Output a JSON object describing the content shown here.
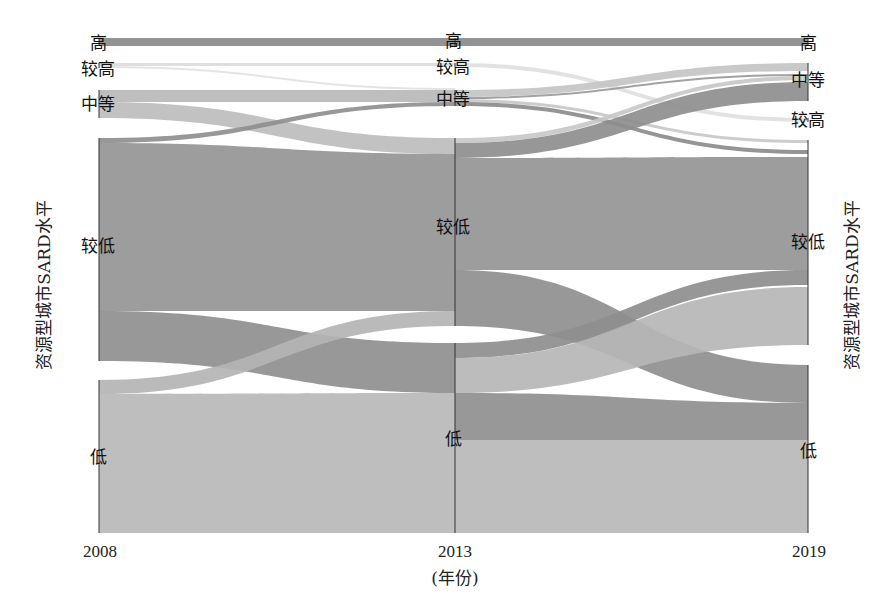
{
  "chart_data": {
    "type": "alluvial",
    "title": "",
    "xlabel": "(年份)",
    "ylabel_left": "资源型城市SARD水平",
    "ylabel_right": "资源型城市SARD水平",
    "columns": [
      "2008",
      "2013",
      "2019"
    ],
    "levels": [
      "高",
      "较高",
      "中等",
      "较低",
      "低"
    ],
    "nodes": {
      "2008": [
        {
          "level": "高",
          "y0": 38,
          "y1": 46
        },
        {
          "level": "较高",
          "y0": 63,
          "y1": 68
        },
        {
          "level": "中等",
          "y0": 90,
          "y1": 118
        },
        {
          "level": "较低",
          "y0": 138,
          "y1": 361
        },
        {
          "level": "低",
          "y0": 380,
          "y1": 533
        }
      ],
      "2013": [
        {
          "level": "高",
          "y0": 38,
          "y1": 46
        },
        {
          "level": "较高",
          "y0": 63,
          "y1": 67
        },
        {
          "level": "中等",
          "y0": 90,
          "y1": 106
        },
        {
          "level": "较低",
          "y0": 138,
          "y1": 326
        },
        {
          "level": "低",
          "y0": 343,
          "y1": 533
        }
      ],
      "2019": [
        {
          "level": "高",
          "y0": 38,
          "y1": 46
        },
        {
          "level": "中等",
          "y0": 63,
          "y1": 101
        },
        {
          "level": "较高",
          "y0": 118,
          "y1": 122
        },
        {
          "level": "较低",
          "y0": 140,
          "y1": 345
        },
        {
          "level": "低",
          "y0": 365,
          "y1": 533
        }
      ]
    },
    "flows": [
      {
        "from": "2008.高",
        "to": "2013.高",
        "sy0": 38,
        "sy1": 46,
        "ty0": 38,
        "ty1": 46,
        "color": "#8a8a8a"
      },
      {
        "from": "2008.较高",
        "to": "2013.较高",
        "sy0": 63,
        "sy1": 66,
        "ty0": 63,
        "ty1": 66,
        "color": "#dcdcdc"
      },
      {
        "from": "2008.较高",
        "to": "2013.中等",
        "sy0": 66,
        "sy1": 68,
        "ty0": 88,
        "ty1": 90,
        "color": "#e2e2e2"
      },
      {
        "from": "2008.中等",
        "to": "2013.中等",
        "sy0": 90,
        "sy1": 102,
        "ty0": 90,
        "ty1": 102,
        "color": "#b8b8b8"
      },
      {
        "from": "2008.中等",
        "to": "2013.较低",
        "sy0": 102,
        "sy1": 118,
        "ty0": 138,
        "ty1": 154,
        "color": "#bdbdbd"
      },
      {
        "from": "2008.较低",
        "to": "2013.中等",
        "sy0": 138,
        "sy1": 143,
        "ty0": 102,
        "ty1": 106,
        "color": "#8f8f8f"
      },
      {
        "from": "2008.较低",
        "to": "2013.较低",
        "sy0": 143,
        "sy1": 311,
        "ty0": 154,
        "ty1": 311,
        "color": "#959595"
      },
      {
        "from": "2008.较低",
        "to": "2013.低",
        "sy0": 311,
        "sy1": 361,
        "ty0": 343,
        "ty1": 393,
        "color": "#8f8f8f"
      },
      {
        "from": "2008.低",
        "to": "2013.较低",
        "sy0": 380,
        "sy1": 394,
        "ty0": 311,
        "ty1": 326,
        "color": "#b4b4b4"
      },
      {
        "from": "2008.低",
        "to": "2013.低",
        "sy0": 394,
        "sy1": 533,
        "ty0": 393,
        "ty1": 533,
        "color": "#b9b9b9"
      },
      {
        "from": "2013.高",
        "to": "2019.高",
        "sy0": 38,
        "sy1": 46,
        "ty0": 38,
        "ty1": 46,
        "color": "#8a8a8a"
      },
      {
        "from": "2013.较高",
        "to": "2019.较高",
        "sy0": 63,
        "sy1": 67,
        "ty0": 118,
        "ty1": 122,
        "color": "#e0e0e0"
      },
      {
        "from": "2013.中等",
        "to": "2019.中等",
        "sy0": 90,
        "sy1": 97,
        "ty0": 63,
        "ty1": 71,
        "color": "#c4c4c4"
      },
      {
        "from": "2013.中等",
        "to": "2019.中等",
        "sy0": 97,
        "sy1": 99,
        "ty0": 74,
        "ty1": 76,
        "color": "#9a9a9a"
      },
      {
        "from": "2013.中等",
        "to": "2019.较低",
        "sy0": 99,
        "sy1": 102,
        "ty0": 140,
        "ty1": 143,
        "color": "#c8c8c8"
      },
      {
        "from": "2013.中等",
        "to": "2019.较低",
        "sy0": 102,
        "sy1": 106,
        "ty0": 150,
        "ty1": 154,
        "color": "#8c8c8c"
      },
      {
        "from": "2013.较低",
        "to": "2019.中等",
        "sy0": 138,
        "sy1": 143,
        "ty0": 76,
        "ty1": 80,
        "color": "#c8c8c8"
      },
      {
        "from": "2013.较低",
        "to": "2019.中等",
        "sy0": 143,
        "sy1": 158,
        "ty0": 82,
        "ty1": 101,
        "color": "#8e8e8e"
      },
      {
        "from": "2013.较低",
        "to": "2019.较低",
        "sy0": 158,
        "sy1": 270,
        "ty0": 157,
        "ty1": 270,
        "color": "#959595"
      },
      {
        "from": "2013.较低",
        "to": "2019.低",
        "sy0": 270,
        "sy1": 326,
        "ty0": 365,
        "ty1": 403,
        "color": "#8f8f8f"
      },
      {
        "from": "2013.低",
        "to": "2019.较低",
        "sy0": 343,
        "sy1": 358,
        "ty0": 270,
        "ty1": 285,
        "color": "#8e8e8e"
      },
      {
        "from": "2013.低",
        "to": "2019.较低",
        "sy0": 358,
        "sy1": 393,
        "ty0": 287,
        "ty1": 345,
        "color": "#b6b6b6"
      },
      {
        "from": "2013.低",
        "to": "2019.低",
        "sy0": 393,
        "sy1": 440,
        "ty0": 403,
        "ty1": 440,
        "color": "#8f8f8f"
      },
      {
        "from": "2013.低",
        "to": "2019.低",
        "sy0": 440,
        "sy1": 533,
        "ty0": 440,
        "ty1": 533,
        "color": "#b9b9b9"
      }
    ],
    "layout": {
      "x_positions": {
        "2008": 99,
        "2013": 455,
        "2019": 808
      },
      "node_line_color": "#333333",
      "grid": false,
      "legend": "none"
    }
  },
  "labels": {
    "2008": [
      {
        "text": "高",
        "x": 98,
        "y": 49,
        "anchor": "middle"
      },
      {
        "text": "较高",
        "x": 98,
        "y": 75,
        "anchor": "middle"
      },
      {
        "text": "中等",
        "x": 98,
        "y": 110,
        "anchor": "middle"
      },
      {
        "text": "较低",
        "x": 98,
        "y": 252,
        "anchor": "middle"
      },
      {
        "text": "低",
        "x": 98,
        "y": 463,
        "anchor": "middle"
      }
    ],
    "2013": [
      {
        "text": "高",
        "x": 453,
        "y": 47,
        "anchor": "middle"
      },
      {
        "text": "较高",
        "x": 453,
        "y": 73,
        "anchor": "middle"
      },
      {
        "text": "中等",
        "x": 453,
        "y": 105,
        "anchor": "middle"
      },
      {
        "text": "较低",
        "x": 453,
        "y": 233,
        "anchor": "middle"
      },
      {
        "text": "低",
        "x": 453,
        "y": 445,
        "anchor": "middle"
      }
    ],
    "2019": [
      {
        "text": "高",
        "x": 808,
        "y": 49,
        "anchor": "middle"
      },
      {
        "text": "中等",
        "x": 808,
        "y": 86,
        "anchor": "middle"
      },
      {
        "text": "较高",
        "x": 808,
        "y": 126,
        "anchor": "middle"
      },
      {
        "text": "较低",
        "x": 808,
        "y": 248,
        "anchor": "middle"
      },
      {
        "text": "低",
        "x": 808,
        "y": 457,
        "anchor": "middle"
      }
    ]
  },
  "axis": {
    "ticks": [
      {
        "text": "2008",
        "x": 100
      },
      {
        "text": "2013",
        "x": 455
      },
      {
        "text": "2019",
        "x": 809
      }
    ],
    "xlabel": "(年份)",
    "ylabel_left": "资源型城市SARD水平",
    "ylabel_right": "资源型城市SARD水平"
  }
}
